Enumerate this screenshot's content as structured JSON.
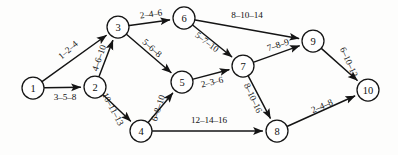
{
  "diagram": {
    "type": "directed-graph",
    "canvas": {
      "width": 398,
      "height": 155
    },
    "colors": {
      "background": "#fdfdfc",
      "stroke": "#141414",
      "node_fill": "#ffffff",
      "text": "#101010"
    },
    "nodes": [
      {
        "id": "1",
        "label": "1",
        "x": 33,
        "y": 88,
        "r": 11
      },
      {
        "id": "2",
        "label": "2",
        "x": 95,
        "y": 87,
        "r": 11
      },
      {
        "id": "3",
        "label": "3",
        "x": 118,
        "y": 27,
        "r": 11
      },
      {
        "id": "4",
        "label": "4",
        "x": 141,
        "y": 131,
        "r": 11
      },
      {
        "id": "5",
        "label": "5",
        "x": 182,
        "y": 82,
        "r": 11
      },
      {
        "id": "6",
        "label": "6",
        "x": 184,
        "y": 18,
        "r": 11
      },
      {
        "id": "7",
        "label": "7",
        "x": 243,
        "y": 66,
        "r": 11
      },
      {
        "id": "8",
        "label": "8",
        "x": 277,
        "y": 131,
        "r": 11
      },
      {
        "id": "9",
        "label": "9",
        "x": 313,
        "y": 41,
        "r": 11
      },
      {
        "id": "10",
        "label": "10",
        "x": 368,
        "y": 90,
        "r": 11
      }
    ],
    "edges": [
      {
        "from": "1",
        "to": "3",
        "label": "1–2–4",
        "weights": [
          1,
          2,
          4
        ],
        "lx": 68,
        "ly": 50,
        "rot": -41
      },
      {
        "from": "1",
        "to": "2",
        "label": "3–5–8",
        "weights": [
          3,
          5,
          8
        ],
        "lx": 65,
        "ly": 97,
        "rot": 0
      },
      {
        "from": "2",
        "to": "3",
        "label": "4–6–10",
        "weights": [
          4,
          6,
          10
        ],
        "lx": 99,
        "ly": 58,
        "rot": -71
      },
      {
        "from": "2",
        "to": "4",
        "label": "10–11–13",
        "weights": [
          10,
          11,
          13
        ],
        "lx": 113,
        "ly": 109,
        "rot": 62
      },
      {
        "from": "3",
        "to": "6",
        "label": "2–4–6",
        "weights": [
          2,
          4,
          6
        ],
        "lx": 151,
        "ly": 14,
        "rot": -8
      },
      {
        "from": "3",
        "to": "5",
        "label": "5–6–8",
        "weights": [
          5,
          6,
          8
        ],
        "lx": 152,
        "ly": 48,
        "rot": 42
      },
      {
        "from": "4",
        "to": "5",
        "label": "6–8–10",
        "weights": [
          6,
          8,
          10
        ],
        "lx": 158,
        "ly": 108,
        "rot": -72
      },
      {
        "from": "4",
        "to": "8",
        "label": "12–14–16",
        "weights": [
          12,
          14,
          16
        ],
        "lx": 209,
        "ly": 120,
        "rot": 0
      },
      {
        "from": "5",
        "to": "7",
        "label": "2–3–6",
        "weights": [
          2,
          3,
          6
        ],
        "lx": 212,
        "ly": 82,
        "rot": -13
      },
      {
        "from": "6",
        "to": "9",
        "label": "8–10–14",
        "weights": [
          8,
          10,
          14
        ],
        "lx": 247,
        "ly": 15,
        "rot": 0
      },
      {
        "from": "6",
        "to": "7",
        "label": "5–7–10",
        "weights": [
          5,
          7,
          10
        ],
        "lx": 207,
        "ly": 42,
        "rot": 37
      },
      {
        "from": "7",
        "to": "9",
        "label": "7–8–9",
        "weights": [
          7,
          8,
          9
        ],
        "lx": 278,
        "ly": 45,
        "rot": -18
      },
      {
        "from": "7",
        "to": "8",
        "label": "8–10–16",
        "weights": [
          8,
          10,
          16
        ],
        "lx": 253,
        "ly": 98,
        "rot": 65
      },
      {
        "from": "8",
        "to": "10",
        "label": "2–4–8",
        "weights": [
          2,
          4,
          8
        ],
        "lx": 322,
        "ly": 106,
        "rot": -23
      },
      {
        "from": "9",
        "to": "10",
        "label": "6–10–12",
        "weights": [
          6,
          10,
          12
        ],
        "lx": 349,
        "ly": 62,
        "rot": 66
      }
    ]
  }
}
